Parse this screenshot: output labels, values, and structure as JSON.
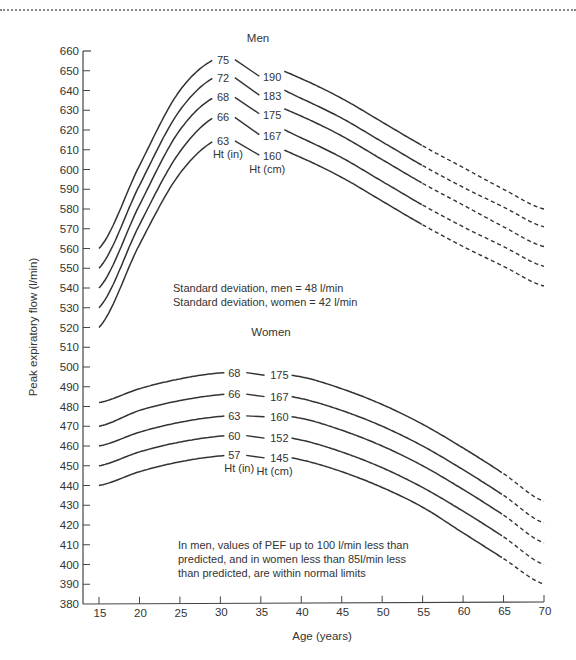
{
  "chart_data": {
    "type": "line",
    "xlabel": "Age (years)",
    "ylabel": "Peak expiratory flow (l/min)",
    "xlim": [
      15,
      70
    ],
    "ylim": [
      380,
      660
    ],
    "x_ticks": [
      15,
      20,
      25,
      30,
      35,
      40,
      45,
      50,
      55,
      60,
      65,
      70
    ],
    "y_ticks": [
      380,
      390,
      400,
      410,
      420,
      430,
      440,
      450,
      460,
      470,
      480,
      490,
      500,
      510,
      520,
      530,
      540,
      550,
      560,
      570,
      580,
      590,
      600,
      610,
      620,
      630,
      640,
      650,
      660
    ],
    "grid": false,
    "panels": [
      {
        "title": "Men",
        "series_label_in": "Ht (in)",
        "series_label_cm": "Ht (cm)",
        "solid_until_age": 55,
        "dashed_from_age": 55,
        "series": [
          {
            "name": "75 in / 190 cm",
            "ht_in": "75",
            "ht_cm": "190",
            "x": [
              15,
              20,
              25,
              30,
              35,
              40,
              45,
              50,
              55,
              60,
              65,
              70
            ],
            "values": [
              560,
              602,
              640,
              657,
              654,
              646,
              636,
              624,
              612,
              601,
              590,
              580
            ]
          },
          {
            "name": "72 in / 183 cm",
            "ht_in": "72",
            "ht_cm": "183",
            "x": [
              15,
              20,
              25,
              30,
              35,
              40,
              45,
              50,
              55,
              60,
              65,
              70
            ],
            "values": [
              550,
              592,
              630,
              648,
              645,
              636,
              626,
              614,
              602,
              591,
              581,
              571
            ]
          },
          {
            "name": "68 in / 175 cm",
            "ht_in": "68",
            "ht_cm": "175",
            "x": [
              15,
              20,
              25,
              30,
              35,
              40,
              45,
              50,
              55,
              60,
              65,
              70
            ],
            "values": [
              540,
              582,
              620,
              638,
              635,
              627,
              617,
              605,
              593,
              582,
              571,
              561
            ]
          },
          {
            "name": "66 in / 167 cm",
            "ht_in": "66",
            "ht_cm": "167",
            "x": [
              15,
              20,
              25,
              30,
              35,
              40,
              45,
              50,
              55,
              60,
              65,
              70
            ],
            "values": [
              530,
              572,
              609,
              628,
              625,
              616,
              606,
              594,
              582,
              571,
              561,
              551
            ]
          },
          {
            "name": "63 in / 160 cm",
            "ht_in": "63",
            "ht_cm": "160",
            "x": [
              15,
              20,
              25,
              30,
              35,
              40,
              45,
              50,
              55,
              60,
              65,
              70
            ],
            "values": [
              520,
              562,
              598,
              616,
              614,
              606,
              596,
              584,
              572,
              561,
              551,
              541
            ]
          }
        ]
      },
      {
        "title": "Women",
        "series_label_in": "Ht (in)",
        "series_label_cm": "Ht (cm)",
        "solid_until_age": 65,
        "dashed_from_age": 65,
        "series": [
          {
            "name": "68 in / 175 cm",
            "ht_in": "68",
            "ht_cm": "175",
            "x": [
              15,
              20,
              25,
              30,
              35,
              40,
              45,
              50,
              55,
              60,
              65,
              70
            ],
            "values": [
              482,
              489,
              494,
              497,
              497,
              495,
              489,
              481,
              471,
              459,
              446,
              432
            ]
          },
          {
            "name": "66 in / 167 cm",
            "ht_in": "66",
            "ht_cm": "167",
            "x": [
              15,
              20,
              25,
              30,
              35,
              40,
              45,
              50,
              55,
              60,
              65,
              70
            ],
            "values": [
              470,
              478,
              483,
              486,
              487,
              484,
              478,
              470,
              460,
              448,
              435,
              421
            ]
          },
          {
            "name": "63 in / 160 cm",
            "ht_in": "63",
            "ht_cm": "160",
            "x": [
              15,
              20,
              25,
              30,
              35,
              40,
              45,
              50,
              55,
              60,
              65,
              70
            ],
            "values": [
              460,
              467,
              472,
              475,
              476,
              474,
              468,
              460,
              450,
              438,
              425,
              411
            ]
          },
          {
            "name": "60 in / 152 cm",
            "ht_in": "60",
            "ht_cm": "152",
            "x": [
              15,
              20,
              25,
              30,
              35,
              40,
              45,
              50,
              55,
              60,
              65,
              70
            ],
            "values": [
              450,
              457,
              462,
              465,
              466,
              463,
              457,
              449,
              439,
              427,
              414,
              400
            ]
          },
          {
            "name": "57 in / 145 cm",
            "ht_in": "57",
            "ht_cm": "145",
            "x": [
              15,
              20,
              25,
              30,
              35,
              40,
              45,
              50,
              55,
              60,
              65,
              70
            ],
            "values": [
              440,
              447,
              452,
              455,
              456,
              453,
              447,
              439,
              429,
              416,
              403,
              390
            ]
          }
        ]
      }
    ],
    "annotations": [
      "Standard deviation, men = 48 l/min",
      "Standard deviation, women = 42 l/min",
      "In men, values of PEF up to 100 l/min less than predicted, and in women less than 85l/min less than predicted, are within normal limits"
    ]
  },
  "labels": {
    "men_title": "Men",
    "women_title": "Women",
    "ht_in": "Ht (in)",
    "ht_cm": "Ht (cm)",
    "xlabel": "Age (years)",
    "ylabel": "Peak expiratory flow (l/min)",
    "sd_men": "Standard deviation, men = 48 l/min",
    "sd_women": "Standard deviation, women = 42 l/min",
    "note_line1": "In men, values of PEF up to 100 l/min less than",
    "note_line2": "predicted, and in women less than 85l/min less",
    "note_line3": "than predicted, are within normal limits"
  }
}
